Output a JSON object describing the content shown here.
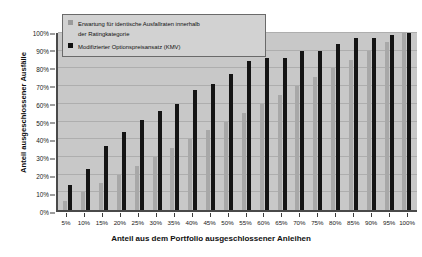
{
  "chart_data": {
    "type": "bar",
    "title": "",
    "xlabel": "Anteil aus dem Portfolio ausgeschlossener Anleihen",
    "ylabel": "Anteil ausgeschlossener Ausfälle",
    "categories": [
      "5%",
      "10%",
      "15%",
      "20%",
      "25%",
      "30%",
      "35%",
      "40%",
      "45%",
      "50%",
      "55%",
      "60%",
      "65%",
      "70%",
      "75%",
      "80%",
      "85%",
      "90%",
      "95%",
      "100%"
    ],
    "series": [
      {
        "name": "Erwartung für identische Ausfallraten innerhalb\nder Ratingkategorie",
        "color": "#a8a8a8",
        "values": [
          5,
          10,
          15,
          20,
          25,
          30,
          35,
          40,
          45,
          50,
          55,
          60,
          65,
          70,
          75,
          80,
          85,
          90,
          95,
          100
        ]
      },
      {
        "name": "Modifizierter Optionspreisansatz (KMV)",
        "color": "#141414",
        "values": [
          14,
          23,
          36,
          44,
          51,
          56,
          60,
          68,
          71,
          77,
          84,
          86,
          86,
          90,
          90,
          94,
          97,
          97,
          99,
          100
        ]
      }
    ],
    "ylim": [
      0,
      100
    ],
    "yticks": [
      "0%",
      "10%",
      "20%",
      "30%",
      "40%",
      "50%",
      "60%",
      "70%",
      "80%",
      "90%",
      "100%"
    ],
    "ytick_values": [
      0,
      10,
      20,
      30,
      40,
      50,
      60,
      70,
      80,
      90,
      100
    ],
    "grid": true,
    "legend_position": "top-left"
  },
  "legend": {
    "items": [
      {
        "label": "Erwartung für identische Ausfallraten innerhalb\nder Ratingkategorie",
        "swatch": "light"
      },
      {
        "label": "Modifizierter Optionspreisansatz (KMV)",
        "swatch": "dark"
      }
    ]
  }
}
